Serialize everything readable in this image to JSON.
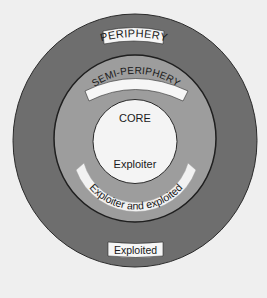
{
  "diagram": {
    "type": "concentric-circles",
    "rings": [
      {
        "id": "periphery",
        "label": "PERIPHERY",
        "role": "Exploited",
        "color": "#6e6e6e"
      },
      {
        "id": "semi-periphery",
        "label": "SEMI-PERIPHERY",
        "role": "Exploiter and exploited",
        "color": "#9d9d9d"
      },
      {
        "id": "core",
        "label": "CORE",
        "role": "Exploiter",
        "color": "#f4f4f4"
      }
    ],
    "colors": {
      "background": "#efefef",
      "outline": "#2a2a2a",
      "label_box": "#f6f6f6",
      "text": "#1a1a1a"
    }
  }
}
